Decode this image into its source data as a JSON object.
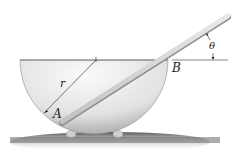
{
  "diagram": {
    "labels": {
      "radius": "r",
      "point_a": "A",
      "point_b": "B",
      "angle": "θ"
    },
    "colors": {
      "bowl_light": "#f4f4f4",
      "bowl_dark": "#9a9a9a",
      "rod": "#d8d8d8",
      "floor": "#6a6a6a",
      "line": "#222222"
    }
  }
}
